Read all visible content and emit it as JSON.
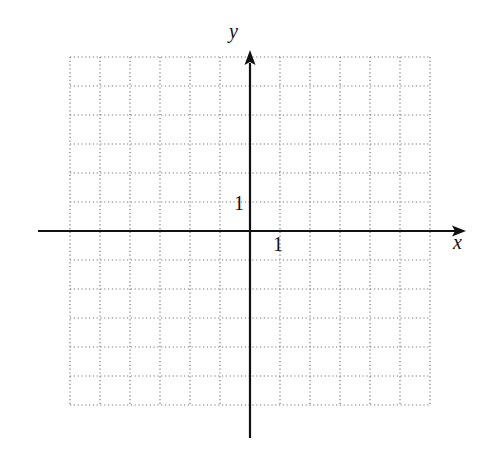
{
  "diagram": {
    "type": "coordinate-grid",
    "axes": {
      "x_label": "x",
      "y_label": "y",
      "x_tick_label": "1",
      "y_tick_label": "1"
    },
    "grid": {
      "columns": 12,
      "rows": 12,
      "x_range": [
        -6,
        6
      ],
      "y_range": [
        -6,
        6
      ],
      "style": "dotted"
    },
    "colors": {
      "axis": "#111111",
      "grid": "#777777",
      "background": "#ffffff"
    }
  }
}
